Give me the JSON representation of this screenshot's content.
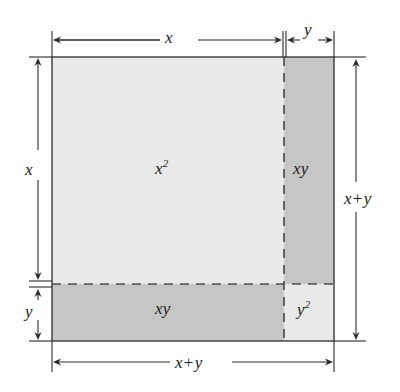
{
  "figure": {
    "type": "area-model-diagram",
    "background_color": "#fdfdfd",
    "outline_color": "#3a3a3a",
    "dash_color": "#4a4a4a",
    "arrow_color": "#2b2b2b",
    "text_color": "#1b1b1b",
    "colors": {
      "light_fill": "#e9e9e9",
      "medium_fill": "#c6c6c6"
    },
    "square": {
      "x": 52,
      "y": 57,
      "width": 282,
      "height": 284,
      "split_x": 284,
      "split_y": 284
    },
    "regions": [
      {
        "name": "x-squared",
        "label_base": "x",
        "label_sup": "2",
        "fill": "#e9e9e9",
        "x": 52,
        "y": 57,
        "width": 232,
        "height": 227
      },
      {
        "name": "xy-right",
        "label_base": "xy",
        "label_sup": "",
        "fill": "#c6c6c6",
        "x": 284,
        "y": 57,
        "width": 50,
        "height": 227
      },
      {
        "name": "xy-bottom",
        "label_base": "xy",
        "label_sup": "",
        "fill": "#c6c6c6",
        "x": 52,
        "y": 284,
        "width": 232,
        "height": 57
      },
      {
        "name": "y-squared",
        "label_base": "y",
        "label_sup": "2",
        "fill": "#e9e9e9",
        "x": 284,
        "y": 284,
        "width": 50,
        "height": 57
      }
    ],
    "labels": {
      "region_x_squared": {
        "base": "x",
        "sup": "2"
      },
      "region_xy_right": {
        "base": "xy",
        "sup": ""
      },
      "region_xy_bottom": {
        "base": "xy",
        "sup": ""
      },
      "region_y_squared": {
        "base": "y",
        "sup": "2"
      }
    },
    "dimensions": [
      {
        "name": "top-x",
        "text": "x",
        "orientation": "horizontal",
        "from": 52,
        "to": 283,
        "axis_pos": 40,
        "label_x": 165,
        "label_y": 29
      },
      {
        "name": "top-y",
        "text": "y",
        "orientation": "horizontal",
        "from": 286,
        "to": 334,
        "axis_pos": 40,
        "label_x": 304,
        "label_y": 21
      },
      {
        "name": "left-x",
        "text": "x",
        "orientation": "vertical",
        "from": 57,
        "to": 281,
        "axis_pos": 38,
        "label_x": 25,
        "label_y": 161
      },
      {
        "name": "left-y",
        "text": "y",
        "orientation": "vertical",
        "from": 287,
        "to": 341,
        "axis_pos": 38,
        "label_x": 25,
        "label_y": 303
      },
      {
        "name": "right-x-plus-y",
        "text": "x + y",
        "orientation": "vertical",
        "from": 57,
        "to": 341,
        "axis_pos": 356,
        "label_x": 344,
        "label_y": 190
      },
      {
        "name": "bottom-x-plus-y",
        "text": "x + y",
        "orientation": "horizontal",
        "from": 52,
        "to": 334,
        "axis_pos": 362,
        "label_x": 175,
        "label_y": 354
      }
    ],
    "dimension_texts": {
      "top_x": "x",
      "top_y": "y",
      "left_x": "x",
      "left_y": "y",
      "right_sum_left": "x",
      "right_sum_op": "+",
      "right_sum_right": "y",
      "bottom_sum_left": "x",
      "bottom_sum_op": "+",
      "bottom_sum_right": "y"
    }
  }
}
